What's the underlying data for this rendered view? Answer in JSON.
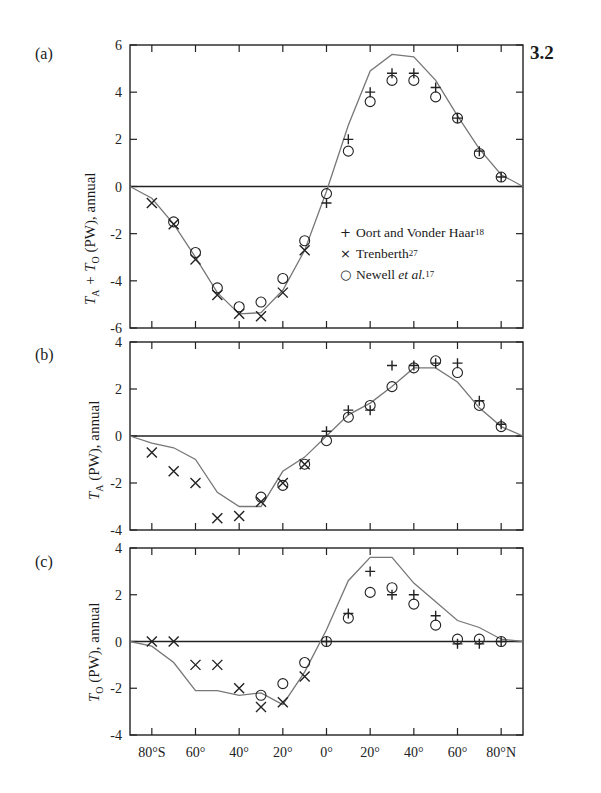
{
  "figure_number": "3.2",
  "legend": {
    "items": [
      {
        "symbol": "+",
        "marker": "plus",
        "label": "Oort and Vonder Haar",
        "ref": "18",
        "italic_part": ""
      },
      {
        "symbol": "×",
        "marker": "cross",
        "label": "Trenberth",
        "ref": "27",
        "italic_part": ""
      },
      {
        "symbol": "○",
        "marker": "circle",
        "label": "Newell ",
        "ref": "17",
        "italic_part": "et al."
      }
    ]
  },
  "x_axis": {
    "ticks": [
      -80,
      -60,
      -40,
      -20,
      0,
      20,
      40,
      60,
      80
    ],
    "tick_labels": [
      "80°S",
      "60°",
      "40°",
      "20°",
      "0°",
      "20°",
      "40°",
      "60°",
      "80°N"
    ],
    "range": [
      -90,
      90
    ]
  },
  "chart_data": [
    {
      "panel": "(a)",
      "type": "line",
      "title": "",
      "xlabel": "Latitude",
      "ylabel": "T_A + T_O (PW), annual",
      "ylabel_parts": {
        "main": "T",
        "sub1": "A",
        "mid": " + T",
        "sub2": "O",
        "rest": " (PW), annual"
      },
      "ylim": [
        -6,
        6
      ],
      "yticks": [
        -6,
        -4,
        -2,
        0,
        2,
        4,
        6
      ],
      "grid": false,
      "zero_line": true,
      "legend_position": "inside-right",
      "series": [
        {
          "name": "Model (solid line)",
          "style": "line",
          "x": [
            -90,
            -80,
            -70,
            -60,
            -50,
            -40,
            -30,
            -20,
            -10,
            0,
            10,
            20,
            30,
            40,
            50,
            60,
            70,
            80,
            90
          ],
          "y": [
            0,
            -0.5,
            -1.6,
            -3.0,
            -4.5,
            -5.4,
            -5.35,
            -4.4,
            -2.7,
            -0.2,
            2.6,
            4.9,
            5.6,
            5.5,
            4.5,
            3.0,
            1.6,
            0.5,
            0
          ]
        },
        {
          "name": "Oort and Vonder Haar",
          "style": "plus",
          "x": [
            0,
            10,
            20,
            30,
            40,
            50,
            60,
            70,
            80
          ],
          "y": [
            -0.7,
            2.0,
            4.0,
            4.8,
            4.8,
            4.2,
            2.9,
            1.5,
            0.4
          ]
        },
        {
          "name": "Trenberth",
          "style": "cross",
          "x": [
            -80,
            -70,
            -60,
            -50,
            -40,
            -30,
            -20,
            -10
          ],
          "y": [
            -0.7,
            -1.6,
            -3.1,
            -4.6,
            -5.4,
            -5.5,
            -4.5,
            -2.7
          ]
        },
        {
          "name": "Newell et al.",
          "style": "circle",
          "x": [
            -70,
            -60,
            -50,
            -40,
            -30,
            -20,
            -10,
            0,
            10,
            20,
            30,
            40,
            50,
            60,
            70,
            80
          ],
          "y": [
            -1.5,
            -2.8,
            -4.3,
            -5.1,
            -4.9,
            -3.9,
            -2.3,
            -0.3,
            1.5,
            3.6,
            4.5,
            4.5,
            3.8,
            2.9,
            1.4,
            0.4
          ]
        }
      ]
    },
    {
      "panel": "(b)",
      "type": "line",
      "title": "",
      "xlabel": "Latitude",
      "ylabel": "T_A (PW), annual",
      "ylabel_parts": {
        "main": "T",
        "sub1": "A",
        "mid": "",
        "sub2": "",
        "rest": " (PW), annual"
      },
      "ylim": [
        -4,
        4
      ],
      "yticks": [
        -4,
        -2,
        0,
        2,
        4
      ],
      "grid": false,
      "zero_line": true,
      "series": [
        {
          "name": "Model (solid line)",
          "style": "line",
          "x": [
            -90,
            -80,
            -70,
            -60,
            -50,
            -40,
            -30,
            -20,
            -10,
            0,
            10,
            20,
            30,
            40,
            50,
            60,
            70,
            80,
            90
          ],
          "y": [
            0,
            -0.3,
            -0.5,
            -1.0,
            -2.4,
            -3.0,
            -3.0,
            -1.5,
            -0.9,
            0,
            0.9,
            1.4,
            2.1,
            2.9,
            2.9,
            2.3,
            1.2,
            0.4,
            0
          ]
        },
        {
          "name": "Oort and Vonder Haar",
          "style": "plus",
          "x": [
            0,
            10,
            20,
            30,
            40,
            50,
            60,
            70,
            80
          ],
          "y": [
            0.2,
            1.1,
            1.1,
            3.0,
            3.0,
            3.1,
            3.1,
            1.5,
            0.5
          ]
        },
        {
          "name": "Trenberth",
          "style": "cross",
          "x": [
            -80,
            -70,
            -60,
            -50,
            -40,
            -30,
            -20,
            -10
          ],
          "y": [
            -0.7,
            -1.5,
            -2.0,
            -3.5,
            -3.4,
            -2.8,
            -2.0,
            -1.2
          ]
        },
        {
          "name": "Newell et al.",
          "style": "circle",
          "x": [
            -30,
            -20,
            -10,
            0,
            10,
            20,
            30,
            40,
            50,
            60,
            70,
            80
          ],
          "y": [
            -2.6,
            -2.1,
            -1.2,
            -0.2,
            0.8,
            1.3,
            2.1,
            2.9,
            3.2,
            2.7,
            1.3,
            0.4
          ]
        }
      ]
    },
    {
      "panel": "(c)",
      "type": "line",
      "title": "",
      "xlabel": "Latitude",
      "ylabel": "T_O (PW), annual",
      "ylabel_parts": {
        "main": "T",
        "sub1": "O",
        "mid": "",
        "sub2": "",
        "rest": " (PW), annual"
      },
      "ylim": [
        -4,
        4
      ],
      "yticks": [
        -4,
        -2,
        0,
        2,
        4
      ],
      "grid": false,
      "zero_line": true,
      "series": [
        {
          "name": "Model (solid line)",
          "style": "line",
          "x": [
            -90,
            -80,
            -70,
            -60,
            -50,
            -40,
            -30,
            -20,
            -10,
            0,
            10,
            20,
            30,
            40,
            50,
            60,
            70,
            80,
            90
          ],
          "y": [
            0,
            -0.2,
            -0.9,
            -2.1,
            -2.1,
            -2.3,
            -2.2,
            -2.7,
            -1.3,
            0.5,
            2.6,
            3.6,
            3.6,
            2.5,
            1.7,
            0.9,
            0.6,
            0.1,
            0
          ]
        },
        {
          "name": "Oort and Vonder Haar",
          "style": "plus",
          "x": [
            0,
            10,
            20,
            30,
            40,
            50,
            60,
            70,
            80
          ],
          "y": [
            0,
            1.2,
            3.0,
            2.0,
            2.0,
            1.1,
            -0.1,
            -0.1,
            0
          ]
        },
        {
          "name": "Trenberth",
          "style": "cross",
          "x": [
            -80,
            -70,
            -60,
            -50,
            -40,
            -30,
            -20,
            -10
          ],
          "y": [
            0,
            0,
            -1.0,
            -1.0,
            -2.0,
            -2.8,
            -2.6,
            -1.5
          ]
        },
        {
          "name": "Newell et al.",
          "style": "circle",
          "x": [
            -30,
            -20,
            -10,
            0,
            10,
            20,
            30,
            40,
            50,
            60,
            70,
            80
          ],
          "y": [
            -2.3,
            -1.8,
            -0.9,
            0,
            1.0,
            2.1,
            2.3,
            1.6,
            0.7,
            0.1,
            0.1,
            0
          ]
        }
      ]
    }
  ],
  "layout": {
    "plot_left": 130,
    "plot_right": 523,
    "panels": [
      {
        "top": 45,
        "bottom": 328
      },
      {
        "top": 342,
        "bottom": 530
      },
      {
        "top": 548,
        "bottom": 735
      }
    ],
    "line_color": "#777777",
    "axis_color": "#222222",
    "marker_color": "#222222"
  }
}
